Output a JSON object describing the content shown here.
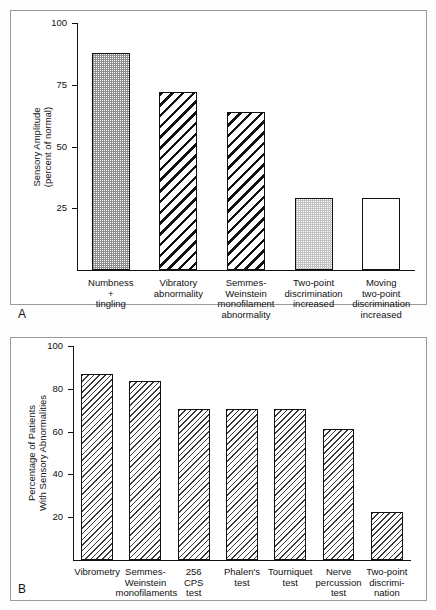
{
  "figure": {
    "panel_a_letter": "A",
    "panel_b_letter": "B"
  },
  "chart_data": [
    {
      "id": "panel-a",
      "type": "bar",
      "title": "",
      "xlabel": "",
      "ylabel": "Sensory Amplitude\n(percent of normal)",
      "ylabel_line1": "Sensory Amplitude",
      "ylabel_line2": "(percent of normal)",
      "ylim": [
        0,
        100
      ],
      "yticks": [
        25,
        50,
        75,
        100
      ],
      "ytick_labels": [
        "25",
        "50",
        "75",
        "100"
      ],
      "grid": false,
      "legend": "none",
      "categories": [
        "Numbness\n+\ntingling",
        "Vibratory\nabnormality",
        "Semmes-\nWeinstein\nmonofilament\nabnormality",
        "Two-point\ndiscrimination\nincreased",
        "Moving\ntwo-point\ndiscrimination\nincreased"
      ],
      "category_lines": [
        [
          "Numbness",
          "+",
          "tingling"
        ],
        [
          "Vibratory",
          "abnormality"
        ],
        [
          "Semmes-",
          "Weinstein",
          "monofilament",
          "abnormality"
        ],
        [
          "Two-point",
          "discrimination",
          "increased"
        ],
        [
          "Moving",
          "two-point",
          "discrimination",
          "increased"
        ]
      ],
      "values": [
        88,
        72,
        64,
        29,
        29
      ],
      "bar_fills": [
        "dots-dark",
        "hatch-back",
        "hatch-back",
        "dots-light",
        "plain"
      ]
    },
    {
      "id": "panel-b",
      "type": "bar",
      "title": "",
      "xlabel": "",
      "ylabel": "Percentage of Patients\nWith Sensory Abnormalities",
      "ylabel_line1": "Percentage of Patients",
      "ylabel_line2": "With Sensory Abnormalities",
      "ylim": [
        0,
        100
      ],
      "yticks": [
        20,
        40,
        60,
        80,
        100
      ],
      "ytick_labels": [
        "20",
        "40",
        "60",
        "80",
        "100"
      ],
      "grid": false,
      "legend": "none",
      "categories": [
        "Vibrometry",
        "Semmes-\nWeinstein\nmonofilaments",
        "256\nCPS\ntest",
        "Phalen's\ntest",
        "Tourniquet\ntest",
        "Nerve\npercussion\ntest",
        "Two-point\ndiscrimi-\nnation"
      ],
      "category_lines": [
        [
          "Vibrometry"
        ],
        [
          "Semmes-",
          "Weinstein",
          "monofilaments"
        ],
        [
          "256",
          "CPS",
          "test"
        ],
        [
          "Phalen's",
          "test"
        ],
        [
          "Tourniquet",
          "test"
        ],
        [
          "Nerve",
          "percussion",
          "test"
        ],
        [
          "Two-point",
          "discrimi-",
          "nation"
        ]
      ],
      "values": [
        87,
        83.5,
        70.5,
        70.5,
        70.5,
        61,
        22.5
      ],
      "bar_fills": [
        "hatch-fine",
        "hatch-fine",
        "hatch-fine",
        "hatch-fine",
        "hatch-fine",
        "hatch-fine",
        "hatch-fine"
      ]
    }
  ]
}
